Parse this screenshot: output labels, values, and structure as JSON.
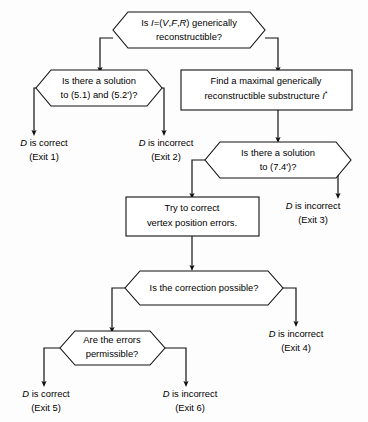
{
  "diagram": {
    "colors": {
      "background": "#fdfdfd",
      "stroke": "#111111",
      "node_fill": "#ffffff",
      "text": "#000000"
    },
    "decisions": [
      {
        "id": "d1",
        "line1_pre": "Is ",
        "line1_var": "I",
        "line1_mid": "=(",
        "line1_v": "V",
        "line1_c1": ",",
        "line1_f": "F",
        "line1_c2": ",",
        "line1_r": "R",
        "line1_post": ")  generically",
        "line2": "reconstructible?",
        "full_text": "Is I=(V,F,R) generically reconstructible?"
      },
      {
        "id": "d2",
        "line1": "Is there a solution",
        "line2": "to (5.1)  and  (5.2')?",
        "full_text": "Is there a solution to (5.1) and (5.2')?"
      },
      {
        "id": "d3",
        "line1": "Is there  a  solution",
        "line2": "to  (7.4')?",
        "full_text": "Is there a solution to (7.4')?"
      },
      {
        "id": "d4",
        "line1": "Is  the  correction  possible?",
        "line2": "",
        "full_text": "Is the correction possible?"
      },
      {
        "id": "d5",
        "line1": "Are  the  errors",
        "line2": "permissible?",
        "full_text": "Are the errors permissible?"
      }
    ],
    "processes": [
      {
        "id": "p1",
        "line1": "Find a maximal generically",
        "line2_pre": "reconstructible  substructure ",
        "line2_var": "I",
        "line2_sup": "*",
        "full_text": "Find a maximal generically reconstructible substructure I*"
      },
      {
        "id": "p2",
        "line1": "Try  to  correct",
        "line2": "vertex  position  errors.",
        "full_text": "Try to correct vertex position errors."
      }
    ],
    "terminals": [
      {
        "id": "t1",
        "var": "D",
        "verdict": " is correct",
        "exit": "(Exit 1)"
      },
      {
        "id": "t2",
        "var": "D",
        "verdict": " is incorrect",
        "exit": "(Exit 2)"
      },
      {
        "id": "t3",
        "var": "D",
        "verdict": " is incorrect",
        "exit": "(Exit 3)"
      },
      {
        "id": "t4",
        "var": "D",
        "verdict": " is incorrect",
        "exit": "(Exit 4)"
      },
      {
        "id": "t5",
        "var": "D",
        "verdict": " is correct",
        "exit": "(Exit 5)"
      },
      {
        "id": "t6",
        "var": "D",
        "verdict": " is incorrect",
        "exit": "(Exit 6)"
      }
    ]
  }
}
